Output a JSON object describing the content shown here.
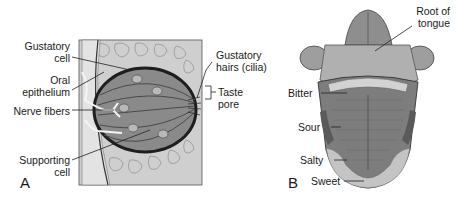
{
  "figure": {
    "panel_a": {
      "letter": "A",
      "title": "Taste bud",
      "labels": {
        "gustatory_cell_1": "Gustatory",
        "gustatory_cell_2": "cell",
        "oral_epithelium_1": "Oral",
        "oral_epithelium_2": "epithelium",
        "nerve_fibers": "Nerve fibers",
        "supporting_cell_1": "Supporting",
        "supporting_cell_2": "cell",
        "gustatory_hairs_1": "Gustatory",
        "gustatory_hairs_2": "hairs (cilia)",
        "taste_pore_1": "Taste",
        "taste_pore_2": "pore"
      }
    },
    "panel_b": {
      "letter": "B",
      "title": "Tongue taste regions",
      "labels": {
        "root_1": "Root of",
        "root_2": "tongue",
        "bitter": "Bitter",
        "sour": "Sour",
        "salty": "Salty",
        "sweet": "Sweet"
      }
    },
    "colors": {
      "label_text": "#1a1a1a",
      "leader_line": "#222222",
      "tissue_light": "#d8d8d8",
      "tissue_mid": "#9a9a9a",
      "tissue_dark": "#3a3a3a",
      "tongue_body": "#7d7d7d",
      "tongue_tip": "#c4c4c4"
    }
  }
}
